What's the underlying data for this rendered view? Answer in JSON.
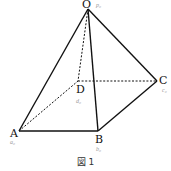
{
  "figure": {
    "caption": "図 1",
    "colors": {
      "edge": "#111111",
      "label": "#111111",
      "sublabel": "#9a9a9a",
      "background": "#ffffff"
    },
    "vertices": {
      "O": {
        "label": "O",
        "sublabel": "p₀",
        "x": 88,
        "y": 9
      },
      "A": {
        "label": "A",
        "sublabel": "a₀",
        "x": 19,
        "y": 131
      },
      "B": {
        "label": "B",
        "sublabel": "b₀",
        "x": 98,
        "y": 131
      },
      "C": {
        "label": "C",
        "sublabel": "c₀",
        "x": 157,
        "y": 81
      },
      "D": {
        "label": "D",
        "sublabel": "d₀",
        "x": 78,
        "y": 81
      }
    },
    "edges": {
      "solid": [
        [
          "O",
          "A"
        ],
        [
          "O",
          "B"
        ],
        [
          "O",
          "C"
        ],
        [
          "A",
          "B"
        ],
        [
          "B",
          "C"
        ]
      ],
      "dashed": [
        [
          "O",
          "D"
        ],
        [
          "A",
          "D"
        ],
        [
          "D",
          "C"
        ]
      ]
    }
  }
}
